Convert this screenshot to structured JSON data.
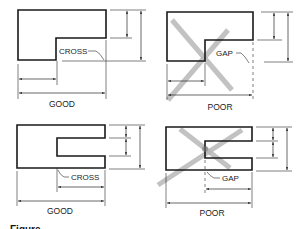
{
  "figure": {
    "caption_partial": "Figure",
    "panels": [
      {
        "id": "top-left",
        "verdict": "GOOD",
        "callout": "CROSS",
        "crossed_out": false
      },
      {
        "id": "top-right",
        "verdict": "POOR",
        "callout": "GAP",
        "crossed_out": true
      },
      {
        "id": "bottom-left",
        "verdict": "GOOD",
        "callout": "CROSS",
        "crossed_out": false
      },
      {
        "id": "bottom-right",
        "verdict": "POOR",
        "callout": "GAP",
        "crossed_out": true
      }
    ]
  },
  "colors": {
    "line": "#1a1a1a",
    "cross_mark": "#b8b8b8",
    "background": "#ffffff"
  }
}
